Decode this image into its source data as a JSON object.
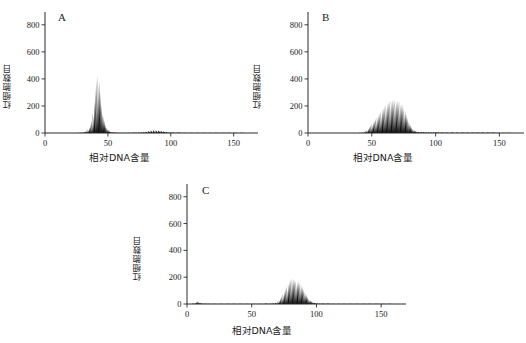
{
  "figure": {
    "background": "#ffffff",
    "ink": "#0d0d0d",
    "panels": [
      "A",
      "B",
      "C"
    ]
  },
  "panelA": {
    "letter": "A"
  },
  "panelB": {
    "letter": "B"
  },
  "panelC": {
    "letter": "C"
  },
  "chart_data": [
    {
      "type": "bar",
      "title": "A",
      "xlabel": "相对DNA含量",
      "ylabel": "红细胞数目",
      "xlim": [
        0,
        163
      ],
      "ylim": [
        0,
        880
      ],
      "xticks": [
        0,
        50,
        100,
        150
      ],
      "yticks": [
        0,
        200,
        400,
        600,
        800
      ],
      "grid": false,
      "legend": "none",
      "x": [
        26,
        28,
        30,
        31,
        32,
        33,
        34,
        35,
        36,
        37,
        38,
        39,
        40,
        41,
        42,
        43,
        44,
        45,
        46,
        47,
        48,
        49,
        50,
        51,
        52,
        53,
        54,
        56,
        58,
        60,
        62,
        64,
        66,
        68,
        70,
        72,
        74,
        76,
        78,
        80,
        82,
        84,
        86,
        88,
        90,
        92,
        94,
        96,
        98,
        100,
        105,
        110,
        115,
        120,
        125,
        130,
        135,
        140,
        145,
        150,
        155,
        160
      ],
      "values": [
        2,
        3,
        5,
        8,
        12,
        18,
        28,
        40,
        62,
        95,
        150,
        235,
        330,
        400,
        425,
        390,
        300,
        210,
        140,
        95,
        62,
        40,
        26,
        16,
        10,
        7,
        5,
        3,
        2,
        2,
        2,
        2,
        2,
        2,
        3,
        3,
        4,
        5,
        7,
        10,
        14,
        18,
        20,
        21,
        20,
        17,
        13,
        9,
        6,
        4,
        3,
        2,
        2,
        2,
        2,
        2,
        1,
        1,
        1,
        1,
        1,
        1
      ]
    },
    {
      "type": "bar",
      "title": "B",
      "xlabel": "相对DNA含量",
      "ylabel": "红细胞数目",
      "xlim": [
        0,
        163
      ],
      "ylim": [
        0,
        880
      ],
      "xticks": [
        0,
        50,
        100,
        150
      ],
      "yticks": [
        0,
        200,
        400,
        600,
        800
      ],
      "grid": false,
      "legend": "none",
      "x": [
        40,
        42,
        44,
        45,
        46,
        47,
        48,
        49,
        50,
        51,
        52,
        53,
        54,
        55,
        56,
        57,
        58,
        59,
        60,
        61,
        62,
        63,
        64,
        65,
        66,
        67,
        68,
        69,
        70,
        71,
        72,
        73,
        74,
        75,
        76,
        77,
        78,
        79,
        80,
        81,
        82,
        83,
        84,
        85,
        86,
        88,
        90,
        92,
        94,
        96,
        98,
        100,
        104,
        108,
        112,
        116,
        120,
        124,
        128,
        132,
        136,
        140,
        144,
        148,
        152,
        156,
        160
      ],
      "values": [
        2,
        4,
        8,
        14,
        22,
        32,
        45,
        58,
        70,
        82,
        95,
        108,
        122,
        135,
        148,
        162,
        175,
        188,
        200,
        212,
        222,
        232,
        240,
        246,
        250,
        243,
        252,
        238,
        246,
        230,
        236,
        218,
        208,
        190,
        168,
        140,
        112,
        86,
        62,
        44,
        30,
        22,
        16,
        12,
        10,
        8,
        7,
        6,
        6,
        5,
        5,
        5,
        4,
        4,
        4,
        4,
        4,
        3,
        3,
        4,
        3,
        3,
        3,
        2,
        2,
        2,
        2
      ]
    },
    {
      "type": "bar",
      "title": "C",
      "xlabel": "相对DNA含量",
      "ylabel": "红细胞数目",
      "xlim": [
        0,
        163
      ],
      "ylim": [
        0,
        880
      ],
      "xticks": [
        0,
        50,
        100,
        150
      ],
      "yticks": [
        0,
        200,
        400,
        600,
        800
      ],
      "grid": false,
      "legend": "none",
      "x": [
        4,
        6,
        7,
        8,
        9,
        10,
        11,
        12,
        14,
        16,
        20,
        25,
        30,
        35,
        40,
        45,
        50,
        55,
        60,
        64,
        66,
        68,
        70,
        71,
        72,
        73,
        74,
        75,
        76,
        77,
        78,
        79,
        80,
        81,
        82,
        83,
        84,
        85,
        86,
        87,
        88,
        89,
        90,
        91,
        92,
        93,
        94,
        95,
        96,
        97,
        98,
        100,
        102,
        104,
        108,
        112,
        116,
        120,
        125,
        130,
        135,
        140,
        145,
        150,
        155,
        160
      ],
      "values": [
        3,
        8,
        14,
        18,
        15,
        10,
        6,
        4,
        3,
        2,
        2,
        2,
        2,
        2,
        2,
        2,
        2,
        2,
        3,
        4,
        6,
        10,
        18,
        28,
        42,
        58,
        76,
        95,
        115,
        135,
        155,
        172,
        186,
        196,
        190,
        184,
        176,
        168,
        176,
        160,
        148,
        132,
        112,
        92,
        72,
        54,
        40,
        28,
        20,
        14,
        10,
        6,
        4,
        3,
        3,
        2,
        2,
        2,
        2,
        2,
        2,
        2,
        2,
        2,
        1,
        1
      ]
    }
  ]
}
